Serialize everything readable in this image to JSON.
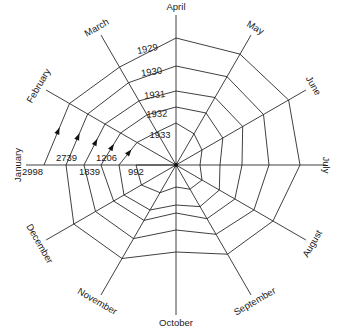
{
  "chart_data": {
    "type": "line",
    "subtype": "spiral-radar",
    "title": "",
    "center": [
      176,
      165
    ],
    "months": [
      "January",
      "February",
      "March",
      "April",
      "May",
      "June",
      "July",
      "August",
      "September",
      "October",
      "November",
      "December"
    ],
    "axis_length": 150,
    "years": [
      "1929",
      "1930",
      "1931",
      "1932",
      "1933"
    ],
    "year_label_positions": [
      {
        "label": "1929",
        "x": 148,
        "y": 52,
        "rot": -12
      },
      {
        "label": "1930",
        "x": 152,
        "y": 75,
        "rot": -8
      },
      {
        "label": "1931",
        "x": 155,
        "y": 98,
        "rot": -6
      },
      {
        "label": "1932",
        "x": 157,
        "y": 117,
        "rot": -4
      },
      {
        "label": "1933",
        "x": 160,
        "y": 138,
        "rot": 0
      }
    ],
    "january_values": [
      {
        "label": "2998",
        "x": 22,
        "y": 175
      },
      {
        "label": "2739",
        "x": 56,
        "y": 161
      },
      {
        "label": "1839",
        "x": 79,
        "y": 175
      },
      {
        "label": "1206",
        "x": 96,
        "y": 161
      },
      {
        "label": "992",
        "x": 128,
        "y": 175
      }
    ],
    "radii_px": [
      [
        132,
        123,
        113,
        127,
        128,
        130,
        124,
        112,
        103,
        87,
        108,
        118
      ],
      [
        110,
        102,
        95,
        99,
        102,
        101,
        93,
        90,
        80,
        65,
        85,
        93
      ],
      [
        92,
        82,
        74,
        74,
        78,
        77,
        66,
        68,
        62,
        48,
        64,
        72
      ],
      [
        75,
        64,
        58,
        58,
        60,
        54,
        44,
        50,
        48,
        40,
        52,
        60
      ],
      [
        57,
        45,
        38,
        42,
        36,
        30,
        24,
        30,
        28,
        22,
        32,
        40
      ],
      [
        40
      ]
    ],
    "estimated_values": {
      "1929": [
        2998,
        2785,
        2560,
        2875,
        2900,
        2945,
        2810,
        2535,
        2335,
        1970,
        2445,
        2670
      ],
      "1930": [
        2739,
        2310,
        2150,
        2240,
        2310,
        2290,
        2105,
        2040,
        1810,
        1470,
        1925,
        2105
      ],
      "1931": [
        1839,
        1855,
        1675,
        1675,
        1765,
        1745,
        1495,
        1540,
        1405,
        1085,
        1450,
        1630
      ],
      "1932": [
        1206,
        1450,
        1315,
        1315,
        1360,
        1225,
        995,
        1130,
        1085,
        905,
        1180,
        1360
      ],
      "1933": [
        992,
        1020,
        860,
        950,
        815,
        680,
        545,
        680,
        635,
        500,
        725,
        905
      ]
    },
    "xlabel": "",
    "ylabel": "",
    "grid": true,
    "legend": "none"
  }
}
